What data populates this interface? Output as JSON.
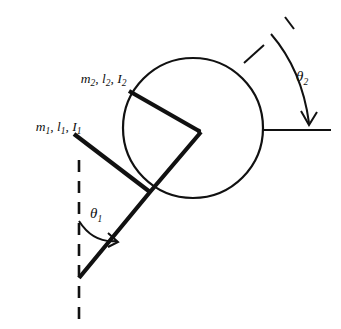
{
  "figure": {
    "background_color": "#ffffff",
    "ink_color": "#111111"
  },
  "labels": {
    "link1": {
      "mass_symbol": "m",
      "mass_sub": "1",
      "length_symbol": "l",
      "length_sub": "1",
      "inertia_symbol": "I",
      "inertia_sub": "1",
      "separator": ", ",
      "full_text": "m1, l1, I1"
    },
    "link2": {
      "mass_symbol": "m",
      "mass_sub": "2",
      "length_symbol": "l",
      "length_sub": "2",
      "inertia_symbol": "I",
      "inertia_sub": "2",
      "separator": ", ",
      "full_text": "m2, l2, I2"
    },
    "angle1": {
      "symbol": "θ",
      "sub": "1",
      "full_text": "θ1"
    },
    "angle2": {
      "symbol": "θ",
      "sub": "2",
      "full_text": "θ2"
    }
  },
  "geometry": {
    "disc": {
      "center_x": 193,
      "center_y": 128,
      "radius": 70
    },
    "hub": {
      "x": 198,
      "y": 130
    },
    "pivot1": {
      "x": 79,
      "y": 278
    },
    "joint": {
      "x": 150,
      "y": 192
    },
    "link1_path": "M 79 278 L 150 192 L 200 132",
    "link1_tail": "M 150 192 L 79 278",
    "link1_upper_tail_end": {
      "x": 73,
      "y": 133
    },
    "link2_path": "M 128 91 L 198 130",
    "link2_tail_end": {
      "x": 135,
      "y": 95
    },
    "dashed_vertical": {
      "x": 79,
      "y_top": 160,
      "y_bottom": 322
    },
    "reference_line_right": {
      "x1": 263,
      "x2": 331,
      "y": 130
    },
    "tick_upper_right": {
      "x1": 245,
      "y1": 62,
      "x2": 263,
      "y2": 46
    },
    "dash_top_right": {
      "x1": 284,
      "y1": 17,
      "x2": 294,
      "y2": 28
    },
    "arc_theta1": {
      "start_x": 79,
      "start_y": 221,
      "end_x": 117,
      "end_y": 241
    },
    "arc_theta2": {
      "start_x": 272,
      "start_y": 35,
      "end_x": 309,
      "end_y": 124
    },
    "theta1_label_pos": {
      "x": 92,
      "y": 216
    },
    "theta2_label_pos": {
      "x": 298,
      "y": 80
    },
    "link1_label_pos": {
      "x": 12,
      "y": 129
    },
    "link2_label_pos": {
      "x": 57,
      "y": 81
    }
  }
}
